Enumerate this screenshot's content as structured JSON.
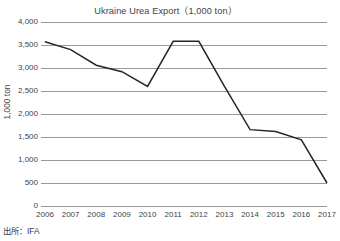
{
  "chart_data": {
    "type": "line",
    "title": "Ukraine Urea Export（1,000 ton）",
    "xlabel": "",
    "ylabel": "1,000 ton",
    "categories": [
      "2006",
      "2007",
      "2008",
      "2009",
      "2010",
      "2011",
      "2012",
      "2013",
      "2014",
      "2015",
      "2016",
      "2017"
    ],
    "values": [
      3570,
      3400,
      3060,
      2920,
      2600,
      3580,
      3580,
      2600,
      1660,
      1620,
      1440,
      500
    ],
    "series": [
      {
        "name": "Ukraine Urea Export",
        "values": [
          3570,
          3400,
          3060,
          2920,
          2600,
          3580,
          3580,
          2600,
          1660,
          1620,
          1440,
          500
        ]
      }
    ],
    "ylim": [
      0,
      4000
    ],
    "ytick_values": [
      0,
      500,
      1000,
      1500,
      2000,
      2500,
      3000,
      3500,
      4000
    ],
    "ytick_labels": [
      "0",
      "500",
      "1,000",
      "1,500",
      "2,000",
      "2,500",
      "3,000",
      "3,500",
      "4,000"
    ],
    "grid": true,
    "legend": false,
    "legend_position": "none",
    "line_color": "#262626",
    "grid_color": "#9a9a9a",
    "background_color": "#ffffff"
  },
  "footer": {
    "source_note": "出所：IFA"
  }
}
